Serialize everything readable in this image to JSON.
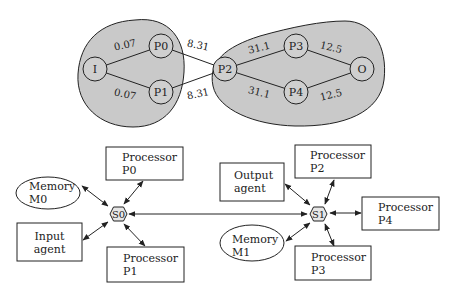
{
  "task_graph": {
    "clusters": [
      {
        "id": "cluster-left",
        "contains": [
          "I",
          "P0",
          "P1"
        ]
      },
      {
        "id": "cluster-right",
        "contains": [
          "P2",
          "P3",
          "P4",
          "O"
        ]
      }
    ],
    "nodes": [
      {
        "id": "I",
        "label": "I"
      },
      {
        "id": "P0",
        "label": "P0"
      },
      {
        "id": "P1",
        "label": "P1"
      },
      {
        "id": "P2",
        "label": "P2"
      },
      {
        "id": "P3",
        "label": "P3"
      },
      {
        "id": "P4",
        "label": "P4"
      },
      {
        "id": "O",
        "label": "O"
      }
    ],
    "edges": [
      {
        "from": "I",
        "to": "P0",
        "weight": "0.07"
      },
      {
        "from": "I",
        "to": "P1",
        "weight": "0.07"
      },
      {
        "from": "P0",
        "to": "P2",
        "weight": "8.31"
      },
      {
        "from": "P1",
        "to": "P2",
        "weight": "8.31"
      },
      {
        "from": "P2",
        "to": "P3",
        "weight": "31.1"
      },
      {
        "from": "P2",
        "to": "P4",
        "weight": "31.1"
      },
      {
        "from": "P3",
        "to": "O",
        "weight": "12.5"
      },
      {
        "from": "P4",
        "to": "O",
        "weight": "12.5"
      }
    ]
  },
  "architecture": {
    "switches": [
      {
        "id": "S0",
        "label": "S0"
      },
      {
        "id": "S1",
        "label": "S1"
      }
    ],
    "components": [
      {
        "id": "proc-p0",
        "line1": "Processor",
        "line2": "P0",
        "switch": "S0"
      },
      {
        "id": "mem-m0",
        "line1": "Memory",
        "line2": "M0",
        "switch": "S0"
      },
      {
        "id": "input-agent",
        "line1": "Input",
        "line2": "agent",
        "switch": "S0"
      },
      {
        "id": "proc-p1",
        "line1": "Processor",
        "line2": "P1",
        "switch": "S0"
      },
      {
        "id": "output-agent",
        "line1": "Output",
        "line2": "agent",
        "switch": "S1"
      },
      {
        "id": "proc-p2",
        "line1": "Processor",
        "line2": "P2",
        "switch": "S1"
      },
      {
        "id": "proc-p4",
        "line1": "Processor",
        "line2": "P4",
        "switch": "S1"
      },
      {
        "id": "mem-m1",
        "line1": "Memory",
        "line2": "M1",
        "switch": "S1"
      },
      {
        "id": "proc-p3",
        "line1": "Processor",
        "line2": "P3",
        "switch": "S1"
      }
    ],
    "links": [
      {
        "from": "S0",
        "to": "S1",
        "bidirectional": true
      }
    ]
  },
  "colors": {
    "cluster_fill": "#c9c9c9",
    "node_fill": "#cfcfcf",
    "stroke": "#222222"
  }
}
